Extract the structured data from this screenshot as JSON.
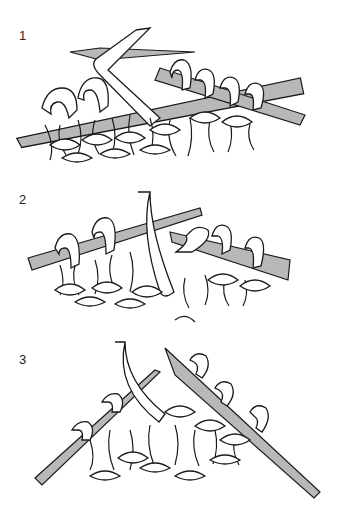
{
  "diagram": {
    "steps": [
      {
        "number": "1",
        "description": "Right needle inserted, yarn wrapped over needle"
      },
      {
        "number": "2",
        "description": "Yarn pulled through loop onto right needle"
      },
      {
        "number": "3",
        "description": "Stitches worked with two needles crossing"
      }
    ],
    "colors": {
      "needle": "#b8b8b8",
      "outline": "#1a1a1a",
      "yarn": "#ffffff",
      "background": "#ffffff"
    }
  }
}
